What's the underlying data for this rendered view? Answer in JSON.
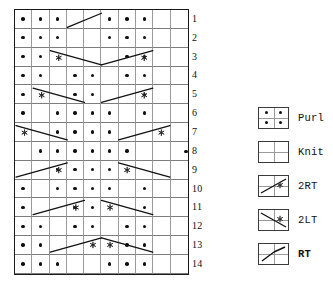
{
  "chart_data": {
    "type": "table",
    "columns": 10,
    "rows": 14,
    "row_labels": [
      "1",
      "2",
      "3",
      "4",
      "5",
      "6",
      "7",
      "8",
      "9",
      "10",
      "11",
      "12",
      "13",
      "14"
    ],
    "symbols": {
      "purl": "Purl",
      "knit": "Knit",
      "2rt": "2RT",
      "2lt": "2LT",
      "rt": "RT"
    },
    "grid": [
      {
        "row": "1",
        "purl": [
          1,
          2,
          3,
          6,
          7,
          8
        ],
        "cables": [
          {
            "type": "rt",
            "col": 4,
            "span": 2
          }
        ]
      },
      {
        "row": "2",
        "purl": [
          1,
          2,
          3,
          6,
          7,
          8
        ],
        "cables": []
      },
      {
        "row": "3",
        "purl": [
          1,
          2,
          7,
          8
        ],
        "cables": [
          {
            "type": "2lt",
            "col": 3,
            "span": 3
          },
          {
            "type": "2rt",
            "col": 6,
            "span": 3
          }
        ]
      },
      {
        "row": "4",
        "purl": [
          1,
          2,
          4,
          5,
          7,
          8
        ],
        "cables": []
      },
      {
        "row": "5",
        "purl": [
          1,
          4,
          5,
          8
        ],
        "cables": [
          {
            "type": "2lt",
            "col": 2,
            "span": 3
          },
          {
            "type": "2rt",
            "col": 6,
            "span": 3
          }
        ]
      },
      {
        "row": "6",
        "purl": [
          1,
          3,
          4,
          5,
          6,
          8
        ],
        "cables": []
      },
      {
        "row": "7",
        "purl": [
          3,
          4,
          5,
          6
        ],
        "cables": [
          {
            "type": "2lt",
            "col": 1,
            "span": 3
          },
          {
            "type": "2rt",
            "col": 7,
            "span": 3
          }
        ]
      },
      {
        "row": "8",
        "purl": [
          2,
          3,
          4,
          5,
          6,
          7
        ],
        "cables": [],
        "edge_dot": true
      },
      {
        "row": "9",
        "purl": [
          3,
          4,
          5,
          6
        ],
        "cables": [
          {
            "type": "2rt",
            "col": 1,
            "span": 3
          },
          {
            "type": "2lt",
            "col": 7,
            "span": 3
          }
        ]
      },
      {
        "row": "10",
        "purl": [
          1,
          3,
          4,
          5,
          6,
          8
        ],
        "cables": []
      },
      {
        "row": "11",
        "purl": [
          1,
          4,
          5,
          8
        ],
        "cables": [
          {
            "type": "2rt",
            "col": 2,
            "span": 3
          },
          {
            "type": "2lt",
            "col": 6,
            "span": 3
          }
        ]
      },
      {
        "row": "12",
        "purl": [
          1,
          2,
          4,
          5,
          7,
          8
        ],
        "cables": []
      },
      {
        "row": "13",
        "purl": [
          1,
          2,
          7,
          8
        ],
        "cables": [
          {
            "type": "2rt",
            "col": 3,
            "span": 3
          },
          {
            "type": "2lt",
            "col": 6,
            "span": 3
          }
        ]
      },
      {
        "row": "14",
        "purl": [
          1,
          2,
          3,
          6,
          7,
          8
        ],
        "cables": []
      }
    ],
    "legend": [
      {
        "symbol": "purl",
        "label": "Purl"
      },
      {
        "symbol": "knit",
        "label": "Knit"
      },
      {
        "symbol": "2rt",
        "label": "2RT"
      },
      {
        "symbol": "2lt",
        "label": "2LT"
      },
      {
        "symbol": "rt",
        "label": "RT"
      }
    ],
    "colors": {
      "grid_outer": "#1a1a1a",
      "grid_inner": "#8d8d8d",
      "dot": "#101010",
      "stroke": "#111111",
      "background": "#ffffff"
    }
  }
}
